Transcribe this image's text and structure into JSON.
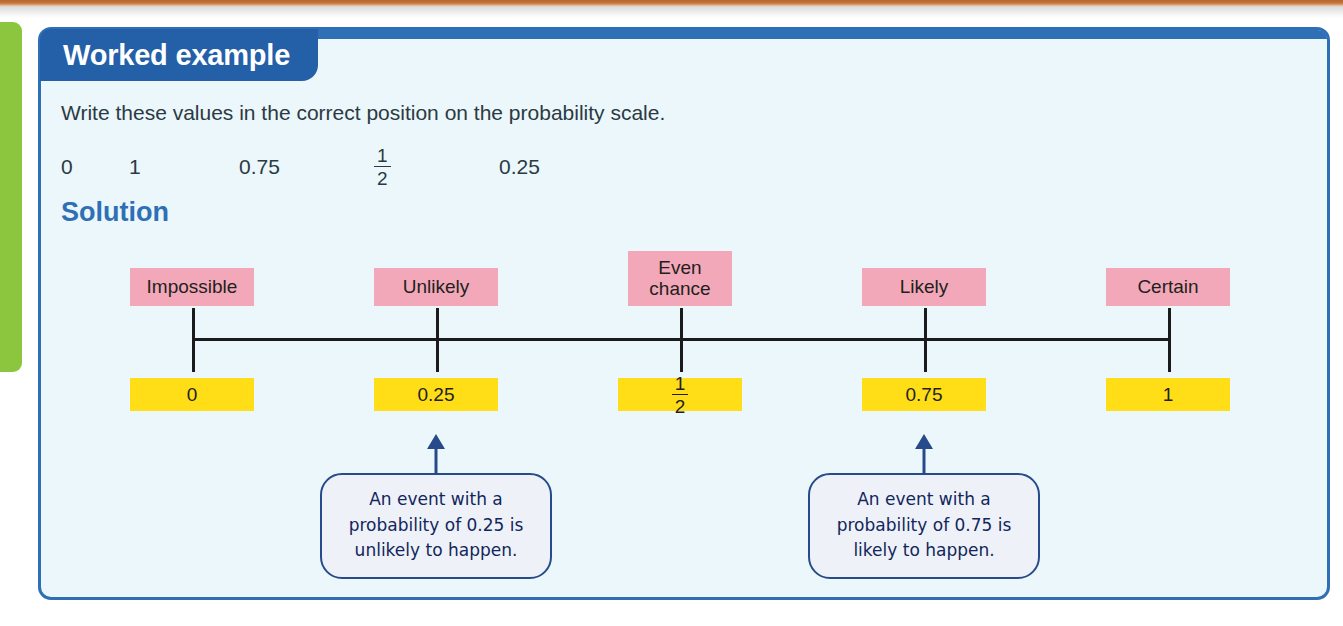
{
  "page": {
    "side_tab_color": "#8cc63e",
    "top_strip_color": "#b4642c"
  },
  "card": {
    "border_color": "#2f6fb5",
    "background_color": "#ebf7fa",
    "header_title": "Worked example",
    "header_color": "#2460a8",
    "prompt": "Write these values in the correct position on the probability scale.",
    "values": [
      {
        "type": "text",
        "text": "0"
      },
      {
        "type": "text",
        "text": "1"
      },
      {
        "type": "text",
        "text": "0.75"
      },
      {
        "type": "fraction",
        "numerator": "1",
        "denominator": "2"
      },
      {
        "type": "text",
        "text": "0.25"
      }
    ],
    "solution_heading": "Solution"
  },
  "chart_data": {
    "type": "line",
    "title": "Probability scale",
    "xlabel": "",
    "ylabel": "",
    "xlim": [
      0,
      1
    ],
    "grid": false,
    "legend": "none",
    "pink_label_color": "#f2a8b8",
    "yellow_label_color": "#ffdd17",
    "line_color": "#1b1b1b",
    "categories": [
      "Impossible",
      "Unlikely",
      "Even chance",
      "Likely",
      "Certain"
    ],
    "values": [
      0,
      0.25,
      0.5,
      0.75,
      1
    ],
    "points": [
      {
        "position": 0,
        "descriptor": "Impossible",
        "descriptor_lines": [
          "Impossible"
        ],
        "value_label": "0",
        "value_is_fraction": false,
        "x_px": 189,
        "pink_width_px": 124,
        "yellow_width_px": 124
      },
      {
        "position": 0.25,
        "descriptor": "Unlikely",
        "descriptor_lines": [
          "Unlikely"
        ],
        "value_label": "0.25",
        "value_is_fraction": false,
        "x_px": 433,
        "pink_width_px": 124,
        "yellow_width_px": 124
      },
      {
        "position": 0.5,
        "descriptor": "Even chance",
        "descriptor_lines": [
          "Even",
          "chance"
        ],
        "value_label": "1/2",
        "value_is_fraction": true,
        "value_numerator": "1",
        "value_denominator": "2",
        "x_px": 677,
        "pink_width_px": 104,
        "yellow_width_px": 124
      },
      {
        "position": 0.75,
        "descriptor": "Likely",
        "descriptor_lines": [
          "Likely"
        ],
        "value_label": "0.75",
        "value_is_fraction": false,
        "x_px": 921,
        "pink_width_px": 124,
        "yellow_width_px": 124
      },
      {
        "position": 1,
        "descriptor": "Certain",
        "descriptor_lines": [
          "Certain"
        ],
        "value_label": "1",
        "value_is_fraction": false,
        "x_px": 1165,
        "pink_width_px": 124,
        "yellow_width_px": 124
      }
    ],
    "annotations": [
      {
        "target_position": 0.25,
        "x_px": 433,
        "lines": [
          "An event with a",
          "probability of 0.25 is",
          "unlikely to happen."
        ],
        "text": "An event with a probability of 0.25 is unlikely to happen."
      },
      {
        "target_position": 0.75,
        "x_px": 921,
        "lines": [
          "An event with a",
          "probability of 0.75 is",
          "likely to happen."
        ],
        "text": "An event with a probability of 0.75 is likely to happen."
      }
    ]
  }
}
